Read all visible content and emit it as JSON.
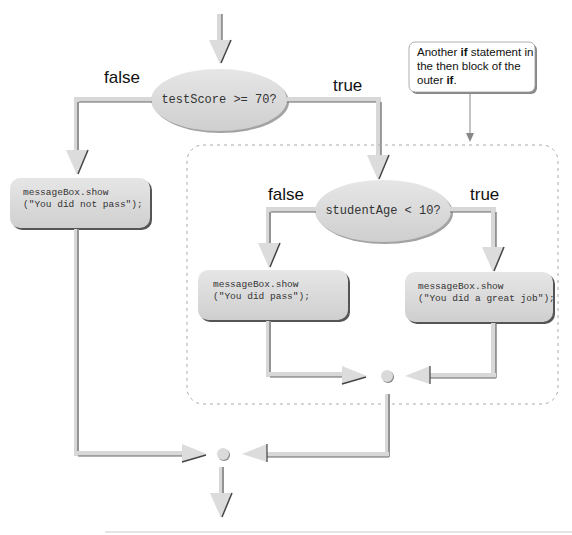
{
  "diagram": {
    "type": "flowchart",
    "outer_condition": {
      "text": "testScore >= 70?",
      "false_label": "false",
      "true_label": "true"
    },
    "outer_false_action": {
      "line1": "messageBox.show",
      "line2": "(\"You did not pass\");"
    },
    "inner_condition": {
      "text": "studentAge < 10?",
      "false_label": "false",
      "true_label": "true"
    },
    "inner_false_action": {
      "line1": "messageBox.show",
      "line2": "(\"You did pass\");"
    },
    "inner_true_action": {
      "line1": "messageBox.show",
      "line2": "(\"You did a great job\");"
    },
    "callout": {
      "part1": "Another ",
      "bold1": "if",
      "part2": " statement in the then block of the outer ",
      "bold2": "if",
      "part3": "."
    },
    "colors": {
      "shape_fill": "#d9d9d9",
      "shape_shadow": "#555555",
      "arrow_fill": "#dcdcdc",
      "line": "#777777",
      "dashed_border": "#aaaaaa",
      "rule": "#cccccc"
    }
  }
}
